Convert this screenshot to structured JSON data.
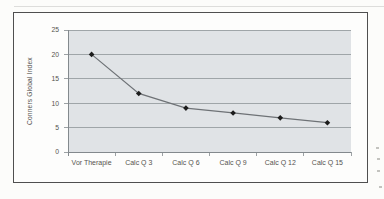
{
  "figure": {
    "page_background": "#fcfcfa",
    "frame_background": "#fdfdfc",
    "frame_border_color": "#4f4f4f",
    "top_edge_line_color": "#d9d9d7",
    "margin_mark_color": "#c3c3bf"
  },
  "chart_data": {
    "type": "line",
    "title": "",
    "xlabel": "",
    "ylabel": "Conners Global Index",
    "categories": [
      "Vor Therapie",
      "Calc Q 3",
      "Calc Q 6",
      "Calc Q 9",
      "Calc Q 12",
      "Calc Q 15"
    ],
    "series": [
      {
        "name": "Conners Global Index",
        "values": [
          20,
          12,
          9,
          8,
          7,
          6
        ]
      }
    ],
    "ylim": [
      0,
      25
    ],
    "yticks": [
      0,
      5,
      10,
      15,
      20,
      25
    ],
    "grid": "horizontal",
    "legend_position": "none",
    "marker_shape": "diamond",
    "colors": {
      "plot_background": "#e0e3e6",
      "gridline": "#8f9599",
      "axis": "#83898d",
      "series_line": "#6e7276",
      "marker": "#1c1c1c",
      "text": "#55534e"
    }
  }
}
